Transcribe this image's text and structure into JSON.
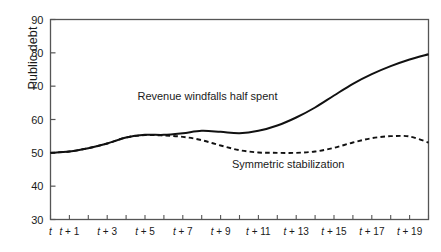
{
  "chart_data": {
    "type": "line",
    "title": "",
    "xlabel": "",
    "ylabel": "Public debt",
    "ylim": [
      30,
      90
    ],
    "xlim": [
      0,
      20
    ],
    "grid": false,
    "legend_position": "inline-annotation",
    "yticks": [
      30,
      40,
      50,
      60,
      70,
      80,
      90
    ],
    "yticklabels": [
      "30",
      "40",
      "50",
      "60",
      "70",
      "80",
      "90"
    ],
    "xticks": [
      0,
      1,
      2,
      3,
      4,
      5,
      6,
      7,
      8,
      9,
      10,
      11,
      12,
      13,
      14,
      15,
      16,
      17,
      18,
      19,
      20
    ],
    "xticklabels": [
      "t",
      "t + 1",
      "",
      "t + 3",
      "",
      "t + 5",
      "",
      "t + 7",
      "",
      "t + 9",
      "",
      "t + 11",
      "",
      "t + 13",
      "",
      "t + 15",
      "",
      "t + 17",
      "",
      "t + 19",
      ""
    ],
    "x": [
      0,
      1,
      2,
      3,
      4,
      5,
      6,
      7,
      8,
      9,
      10,
      11,
      12,
      13,
      14,
      15,
      16,
      17,
      18,
      19,
      20
    ],
    "series": [
      {
        "name": "Revenue windfalls half spent",
        "style": "solid",
        "color": "#111111",
        "values": [
          50.0,
          50.4,
          51.4,
          52.8,
          54.6,
          55.4,
          55.4,
          55.9,
          56.6,
          56.3,
          55.9,
          56.6,
          58.2,
          60.6,
          63.6,
          67.2,
          70.7,
          73.6,
          76.0,
          78.0,
          79.6
        ]
      },
      {
        "name": "Symmetric stabilization",
        "style": "dashed",
        "color": "#111111",
        "values": [
          50.0,
          50.4,
          51.4,
          52.8,
          54.6,
          55.3,
          55.2,
          54.8,
          53.8,
          52.2,
          50.8,
          50.1,
          50.0,
          50.0,
          50.4,
          51.5,
          53.1,
          54.4,
          55.0,
          54.9,
          53.1
        ]
      }
    ],
    "annotations": [
      {
        "text": "Revenue windfalls half spent",
        "x": 4.6,
        "y": 66.0
      },
      {
        "text": "Symmetric stabilization",
        "x": 9.6,
        "y": 45.4
      }
    ]
  },
  "axes": {
    "frame_color": "#555555",
    "tick_color": "#555555"
  }
}
